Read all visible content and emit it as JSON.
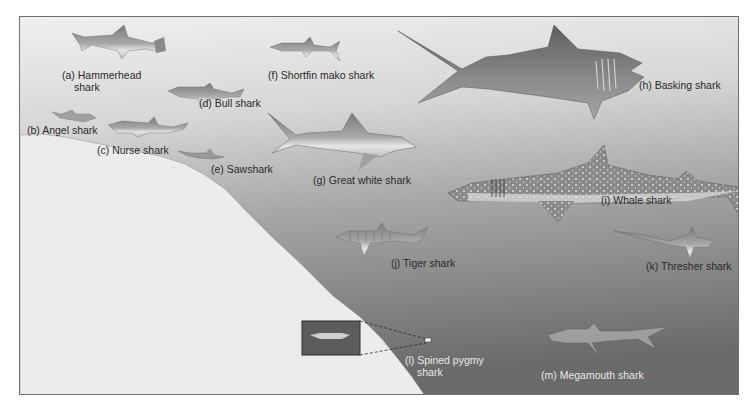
{
  "figure": {
    "colors": {
      "water_top": "#f0f0f0",
      "water_mid": "#bdbdbd",
      "water_deep": "#6f6f6f",
      "seafloor": "#ececec",
      "border": "#6e6e6e",
      "label_dark": "#2a2a2a",
      "label_light": "#e8e8e8"
    },
    "sharks": [
      {
        "id": "a",
        "label_line1": "(a) Hammerhead",
        "label_line2": "shark"
      },
      {
        "id": "b",
        "label_line1": "(b) Angel shark"
      },
      {
        "id": "c",
        "label_line1": "(c) Nurse shark"
      },
      {
        "id": "d",
        "label_line1": "(d) Bull shark"
      },
      {
        "id": "e",
        "label_line1": "(e) Sawshark"
      },
      {
        "id": "f",
        "label_line1": "(f) Shortfin mako shark"
      },
      {
        "id": "g",
        "label_line1": "(g) Great white shark"
      },
      {
        "id": "h",
        "label_line1": "(h) Basking shark"
      },
      {
        "id": "i",
        "label_line1": "(i) Whale shark"
      },
      {
        "id": "j",
        "label_line1": "(j) Tiger shark"
      },
      {
        "id": "k",
        "label_line1": "(k) Thresher shark"
      },
      {
        "id": "l",
        "label_line1": "(l) Spined pygmy",
        "label_line2": "shark"
      },
      {
        "id": "m",
        "label_line1": "(m) Megamouth shark"
      }
    ]
  }
}
